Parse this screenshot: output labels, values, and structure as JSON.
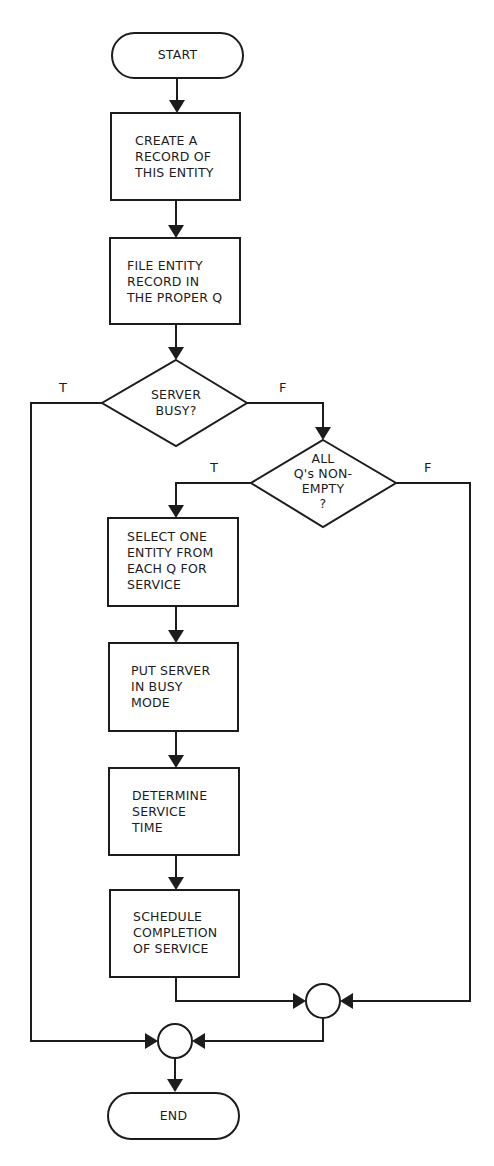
{
  "diagram": {
    "type": "flowchart",
    "stroke_color": "#1c1c1c",
    "background_color": "#ffffff",
    "nodes": {
      "start": {
        "shape": "terminal",
        "label": "START"
      },
      "create_record": {
        "shape": "process",
        "label": "CREATE A\nRECORD OF\nTHIS ENTITY"
      },
      "file_record": {
        "shape": "process",
        "label": "FILE ENTITY\nRECORD IN\nTHE PROPER Q"
      },
      "server_busy": {
        "shape": "decision",
        "label": "SERVER\nBUSY?"
      },
      "all_qs_nonempty": {
        "shape": "decision",
        "label": "ALL\nQ's NON-\nEMPTY\n?"
      },
      "select_entity": {
        "shape": "process",
        "label": "SELECT ONE\nENTITY FROM\nEACH Q FOR\nSERVICE"
      },
      "put_server_busy": {
        "shape": "process",
        "label": "PUT SERVER\nIN BUSY\nMODE"
      },
      "determine_time": {
        "shape": "process",
        "label": "DETERMINE\nSERVICE\nTIME"
      },
      "schedule_completion": {
        "shape": "process",
        "label": "SCHEDULE\nCOMPLETION\nOF SERVICE"
      },
      "connector_right": {
        "shape": "connector",
        "label": ""
      },
      "connector_left": {
        "shape": "connector",
        "label": ""
      },
      "end": {
        "shape": "terminal",
        "label": "END"
      }
    },
    "branch_labels": {
      "server_busy_true": "T",
      "server_busy_false": "F",
      "all_qs_true": "T",
      "all_qs_false": "F"
    },
    "edges": [
      {
        "from": "start",
        "to": "create_record"
      },
      {
        "from": "create_record",
        "to": "file_record"
      },
      {
        "from": "file_record",
        "to": "server_busy"
      },
      {
        "from": "server_busy",
        "to": "connector_left",
        "label": "T"
      },
      {
        "from": "server_busy",
        "to": "all_qs_nonempty",
        "label": "F"
      },
      {
        "from": "all_qs_nonempty",
        "to": "select_entity",
        "label": "T"
      },
      {
        "from": "all_qs_nonempty",
        "to": "connector_right",
        "label": "F"
      },
      {
        "from": "select_entity",
        "to": "put_server_busy"
      },
      {
        "from": "put_server_busy",
        "to": "determine_time"
      },
      {
        "from": "determine_time",
        "to": "schedule_completion"
      },
      {
        "from": "schedule_completion",
        "to": "connector_right"
      },
      {
        "from": "connector_right",
        "to": "connector_left"
      },
      {
        "from": "connector_left",
        "to": "end"
      }
    ]
  }
}
